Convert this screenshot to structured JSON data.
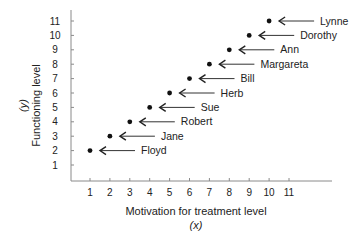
{
  "chart_data": {
    "type": "scatter",
    "title": "",
    "xlabel": "Motivation for treatment level",
    "xlabel_sub": "(x)",
    "ylabel": "Functioning level",
    "ylabel_sub": "(y)",
    "xlim": [
      0,
      12
    ],
    "ylim": [
      0,
      11.5
    ],
    "xticks": [
      1,
      2,
      3,
      4,
      5,
      6,
      7,
      8,
      9,
      10,
      11
    ],
    "yticks": [
      1,
      2,
      3,
      4,
      5,
      6,
      7,
      8,
      9,
      10,
      11
    ],
    "grid": false,
    "points": [
      {
        "name": "Floyd",
        "x": 1,
        "y": 2
      },
      {
        "name": "Jane",
        "x": 2,
        "y": 3
      },
      {
        "name": "Robert",
        "x": 3,
        "y": 4
      },
      {
        "name": "Sue",
        "x": 4,
        "y": 5
      },
      {
        "name": "Herb",
        "x": 5,
        "y": 6
      },
      {
        "name": "Bill",
        "x": 6,
        "y": 7
      },
      {
        "name": "Margareta",
        "x": 7,
        "y": 8
      },
      {
        "name": "Ann",
        "x": 8,
        "y": 9
      },
      {
        "name": "Dorothy",
        "x": 9,
        "y": 10
      },
      {
        "name": "Lynne",
        "x": 10,
        "y": 11
      }
    ],
    "annotation_style": "arrow-pointing-left-to-point"
  }
}
